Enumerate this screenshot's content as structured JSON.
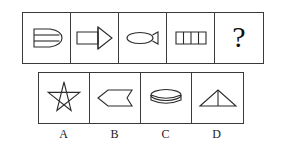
{
  "puzzle": {
    "type": "figure-series-analogy",
    "question_row": {
      "name": "question-sequence",
      "cells": [
        {
          "index": 1,
          "icon": "bullet-dome-with-two-horizontal-lines",
          "description": "Rounded bullet / dome shape with two horizontal internal lines"
        },
        {
          "index": 2,
          "icon": "rectangle-with-funnel-cone",
          "description": "Long rectangle attached to a rightward funnel/cone triangle"
        },
        {
          "index": 3,
          "icon": "fish-ellipse-with-tail",
          "description": "Horizontal ellipse with a small triangular tail on the right"
        },
        {
          "index": 4,
          "icon": "segmented-rectangle-four-cells",
          "description": "Rectangle divided by three vertical lines into four cells"
        },
        {
          "index": 5,
          "icon": "question-mark",
          "label": "?",
          "description": "Missing figure placeholder"
        }
      ]
    },
    "options_row": {
      "name": "answer-options",
      "options": [
        {
          "label": "A",
          "icon": "five-pointed-star-pentagram",
          "description": "Five pointed star drawn as a continuous pentagram"
        },
        {
          "label": "B",
          "icon": "left-pointing-pennant-arrow",
          "description": "Pentagon pennant pointing left with notched right edge"
        },
        {
          "label": "C",
          "icon": "cylinder-disc",
          "description": "Short cylinder / disc shown with top ellipse"
        },
        {
          "label": "D",
          "icon": "triangle-with-median-line",
          "description": "Triangle with a vertical line from apex to base"
        }
      ]
    }
  },
  "colors": {
    "background": "#ffffff",
    "border": "#3a3a3a",
    "stroke": "#2b2b2b",
    "text": "#1a1a1a"
  }
}
